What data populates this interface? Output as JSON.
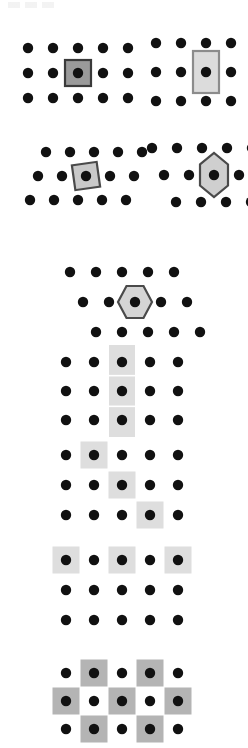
{
  "figure": {
    "background_color": "#ffffff",
    "dot_color": "#111111",
    "dot_radius": 5.2,
    "cell_fill_dark": "#9a9a9a",
    "cell_fill_light": "#dcdcdc",
    "cell_fill_band": "#dedede",
    "cell_stroke_dark": "#3a3a3a",
    "cell_stroke_mid": "#8c8c8c",
    "artifact_label": "top-edge scan artifact"
  },
  "panels": [
    {
      "id": "panel-a",
      "name": "square-unit-cell",
      "lattice": "rectangular",
      "rows": 3,
      "cols": 5,
      "dx": 25,
      "dy": 25,
      "offset_rows": false,
      "origin": {
        "x": 28,
        "y": 48
      },
      "shape": {
        "type": "square",
        "width": 26,
        "height": 26,
        "rotation": 0,
        "fill": "#9a9a9a",
        "stroke": "#3a3a3a",
        "stroke_width": 2.2,
        "center_cell": {
          "row": 1,
          "col": 2
        }
      }
    },
    {
      "id": "panel-b",
      "name": "rectangular-unit-cell",
      "lattice": "rectangular",
      "rows": 3,
      "cols": 5,
      "dx": 25,
      "dy": 29,
      "offset_rows": false,
      "origin": {
        "x": 156,
        "y": 43
      },
      "shape": {
        "type": "rectangle",
        "width": 26,
        "height": 42,
        "rotation": 0,
        "fill": "#dcdcdc",
        "stroke": "#8c8c8c",
        "stroke_width": 2.2,
        "center_cell": {
          "row": 1,
          "col": 2
        }
      }
    },
    {
      "id": "panel-c",
      "name": "oblique-tilted-square-unit-cell",
      "lattice": "oblique-staggered",
      "rows": 3,
      "cols": 5,
      "dx": 24,
      "dy": 24,
      "row_shift": -8,
      "offset_rows": true,
      "origin": {
        "x": 30,
        "y": 152
      },
      "shape": {
        "type": "square",
        "width": 25,
        "height": 25,
        "rotation": -8,
        "fill": "#c9c9c9",
        "stroke": "#4a4a4a",
        "stroke_width": 2.2,
        "center_cell": {
          "row": 1,
          "col": 2
        }
      }
    },
    {
      "id": "panel-d",
      "name": "elongated-hexagon-unit-cell",
      "lattice": "staggered-hexagonal",
      "rows": 3,
      "cols": 5,
      "dx": 25,
      "dy": 27,
      "row_shift": 12,
      "offset_rows": true,
      "origin": {
        "x": 152,
        "y": 148
      },
      "shape": {
        "type": "hexagon-vertical",
        "width": 28,
        "height": 44,
        "rotation": 0,
        "fill": "#cfcfcf",
        "stroke": "#4a4a4a",
        "stroke_width": 2.2,
        "center_cell": {
          "row": 1,
          "col": 2
        }
      }
    },
    {
      "id": "panel-e",
      "name": "regular-hexagon-unit-cell",
      "lattice": "staggered-hexagonal",
      "rows": 3,
      "cols": 5,
      "dx": 26,
      "dy": 30,
      "row_shift": 13,
      "offset_rows": true,
      "origin": {
        "x": 70,
        "y": 272
      },
      "shape": {
        "type": "hexagon-regular",
        "width": 34,
        "height": 32,
        "rotation": 0,
        "fill": "#d5d5d5",
        "stroke": "#4a4a4a",
        "stroke_width": 2.2,
        "center_cell": {
          "row": 1,
          "col": 2
        }
      }
    },
    {
      "id": "panel-f",
      "name": "column-band-tiling",
      "lattice": "rectangular",
      "rows": 3,
      "cols": 5,
      "dx": 28,
      "dy": 29,
      "offset_rows": false,
      "origin": {
        "x": 66,
        "y": 362
      },
      "band": {
        "type": "vertical-band",
        "column": 2,
        "width": 26,
        "fill": "#dedede",
        "divider_color": "#ffffff",
        "divider_count": 2
      }
    },
    {
      "id": "panel-g",
      "name": "diagonal-cell-tiling",
      "lattice": "rectangular",
      "rows": 3,
      "cols": 5,
      "dx": 28,
      "dy": 30,
      "offset_rows": false,
      "origin": {
        "x": 66,
        "y": 455
      },
      "cells": [
        {
          "row": 0,
          "col": 1
        },
        {
          "row": 1,
          "col": 2
        },
        {
          "row": 2,
          "col": 3
        }
      ],
      "cell_size": 27,
      "fill": "#dedede"
    },
    {
      "id": "panel-h",
      "name": "alternating-row-tiling",
      "lattice": "rectangular",
      "rows": 3,
      "cols": 5,
      "dx": 28,
      "dy": 30,
      "offset_rows": false,
      "origin": {
        "x": 66,
        "y": 560
      },
      "cells": [
        {
          "row": 0,
          "col": 0
        },
        {
          "row": 0,
          "col": 2
        },
        {
          "row": 0,
          "col": 4
        }
      ],
      "cell_size": 27,
      "fill": "#dedede"
    },
    {
      "id": "panel-i",
      "name": "checkerboard-tiling",
      "lattice": "rectangular",
      "rows": 3,
      "cols": 5,
      "dx": 28,
      "dy": 28,
      "offset_rows": false,
      "origin": {
        "x": 66,
        "y": 673
      },
      "cells": [
        {
          "row": 0,
          "col": 1
        },
        {
          "row": 0,
          "col": 3
        },
        {
          "row": 1,
          "col": 0
        },
        {
          "row": 1,
          "col": 2
        },
        {
          "row": 1,
          "col": 4
        },
        {
          "row": 2,
          "col": 1
        },
        {
          "row": 2,
          "col": 3
        }
      ],
      "cell_size": 27,
      "fill": "#b4b4b4"
    }
  ]
}
